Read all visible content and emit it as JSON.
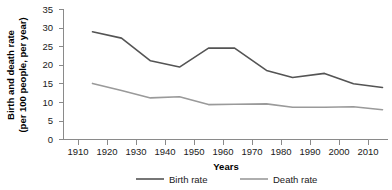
{
  "chart_data": {
    "type": "line",
    "title": "",
    "xlabel": "Years",
    "ylabel": "Birth and death rate\n(per 100 people, per year)",
    "ylabel_line1": "Birth and death rate",
    "ylabel_line2": "(per 100 people, per year)",
    "xlim": [
      1905,
      2017
    ],
    "ylim": [
      0,
      35
    ],
    "xticks": [
      1910,
      1920,
      1930,
      1940,
      1950,
      1960,
      1970,
      1980,
      1990,
      2000,
      2010
    ],
    "yticks": [
      0,
      5,
      10,
      15,
      20,
      25,
      30,
      35
    ],
    "xtick_labels": [
      "1910",
      "1920",
      "1930",
      "1940",
      "1950",
      "1960",
      "1970",
      "1980",
      "1990",
      "2000",
      "2010"
    ],
    "ytick_labels": [
      "0",
      "5",
      "10",
      "15",
      "20",
      "25",
      "30",
      "35"
    ],
    "grid": false,
    "legend_position": "bottom",
    "x": [
      1915,
      1925,
      1935,
      1945,
      1955,
      1964,
      1975,
      1984,
      1995,
      2005,
      2015
    ],
    "series": [
      {
        "name": "Birth rate",
        "color": "#545454",
        "values": [
          29.0,
          27.3,
          21.2,
          19.5,
          24.6,
          24.6,
          18.6,
          16.7,
          17.8,
          15.0,
          14.0
        ]
      },
      {
        "name": "Death rate",
        "color": "#9a9a9a",
        "values": [
          15.1,
          13.2,
          11.2,
          11.5,
          9.4,
          9.5,
          9.6,
          8.7,
          8.7,
          8.8,
          8.0
        ]
      }
    ]
  },
  "legend": {
    "items": [
      {
        "label": "Birth rate",
        "color": "#545454"
      },
      {
        "label": "Death rate",
        "color": "#9a9a9a"
      }
    ]
  },
  "axes": {
    "x_title": "Years",
    "y_title_line1": "Birth and death rate",
    "y_title_line2": "(per 100 people, per year)"
  }
}
